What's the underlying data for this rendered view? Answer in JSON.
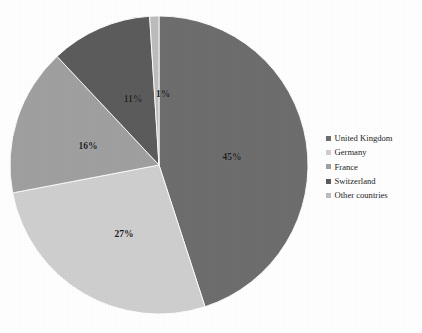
{
  "chart_data": {
    "type": "pie",
    "title": "FIGURE 4. SHARE OF FOREIGN DIRECT INVESTMENT IN SWITZERLAND",
    "categories": [
      "United Kingdom",
      "Germany",
      "France",
      "Switzerland",
      "Other countries"
    ],
    "values": [
      45,
      27,
      16,
      11,
      1
    ],
    "value_labels": [
      "45%",
      "27%",
      "16%",
      "11%",
      "1%"
    ],
    "colors": [
      "#6e6e6e",
      "#cfcfcf",
      "#a0a0a0",
      "#5c5c5c",
      "#bdbdbd"
    ],
    "xlabel": "",
    "ylabel": "",
    "legend_position": "right",
    "grid": false,
    "start_angle_deg": 0,
    "direction": "clockwise",
    "geometry": {
      "cx": 159,
      "cy": 165,
      "r": 149
    },
    "label_positions": [
      {
        "label": "45%",
        "x": 232,
        "y": 157
      },
      {
        "label": "27%",
        "x": 124,
        "y": 234
      },
      {
        "label": "16%",
        "x": 88,
        "y": 146
      },
      {
        "label": "11%",
        "x": 133,
        "y": 99
      },
      {
        "label": "1%",
        "x": 163,
        "y": 94
      }
    ]
  },
  "legend": {
    "items": [
      {
        "label": "United Kingdom",
        "color": "#6e6e6e"
      },
      {
        "label": "Germany",
        "color": "#cfcfcf"
      },
      {
        "label": "France",
        "color": "#a0a0a0"
      },
      {
        "label": "Switzerland",
        "color": "#5c5c5c"
      },
      {
        "label": "Other countries",
        "color": "#bdbdbd"
      }
    ]
  }
}
